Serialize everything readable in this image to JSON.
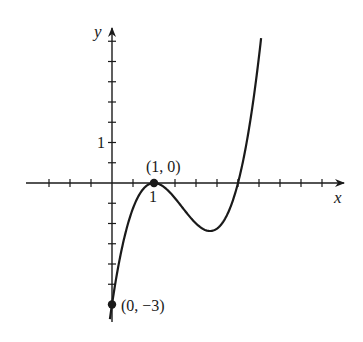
{
  "chart_data": {
    "type": "line",
    "title": "",
    "xlabel": "x",
    "ylabel": "y",
    "function": "f(x) = (x - 1)^2 (x - 3)",
    "x_tick_step": 0.5,
    "y_tick_step": 0.5,
    "x_tick_labels": [
      {
        "value": 1,
        "label": "1"
      }
    ],
    "y_tick_labels": [
      {
        "value": 1,
        "label": "1"
      }
    ],
    "xlim": [
      -2.25,
      5.5
    ],
    "ylim": [
      -3.4,
      3.8
    ],
    "grid": false,
    "legend": null,
    "points": [
      {
        "x": 1,
        "y": 0,
        "label": "(1, 0)"
      },
      {
        "x": 0,
        "y": -3,
        "label": "(0, −3)"
      }
    ],
    "series": [
      {
        "name": "curve",
        "x_range": [
          -0.05,
          3.55
        ],
        "sample_values": [
          [
            0,
            -3
          ],
          [
            0.5,
            -0.625
          ],
          [
            1,
            0
          ],
          [
            1.5,
            -0.375
          ],
          [
            2,
            -1
          ],
          [
            2.333,
            -1.185
          ],
          [
            2.5,
            -1.125
          ],
          [
            3,
            0
          ],
          [
            3.5,
            3.125
          ]
        ]
      }
    ],
    "annotations": [
      "(1, 0)",
      "(0, −3)"
    ]
  }
}
